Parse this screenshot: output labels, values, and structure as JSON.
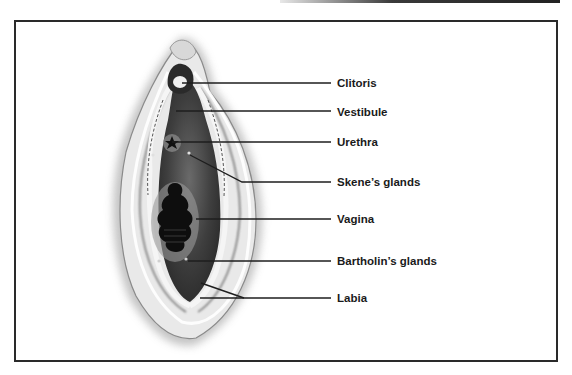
{
  "figure": {
    "type": "anatomical-diagram"
  },
  "labels": [
    {
      "id": "clitoris",
      "text": "Clitoris",
      "y": 76
    },
    {
      "id": "vestibule",
      "text": "Vestibule",
      "y": 105
    },
    {
      "id": "urethra",
      "text": "Urethra",
      "y": 135
    },
    {
      "id": "skenes-glands",
      "text": "Skene’s glands",
      "y": 175
    },
    {
      "id": "vagina",
      "text": "Vagina",
      "y": 212
    },
    {
      "id": "bartholins-glands",
      "text": "Bartholin’s glands",
      "y": 254
    },
    {
      "id": "labia",
      "text": "Labia",
      "y": 291
    }
  ],
  "colors": {
    "line": "#1e1e1e",
    "frame": "#2a2a2a",
    "tissue_dark": "#2a2a2a",
    "tissue_mid": "#8a8a8a",
    "background": "#ffffff"
  }
}
